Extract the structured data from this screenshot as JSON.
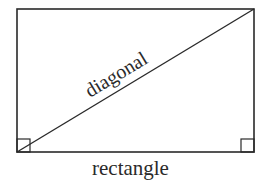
{
  "diagram": {
    "title": "rectangle",
    "shape": "rectangle",
    "labels": {
      "diagonal": "diagonal",
      "shape_name": "rectangle"
    },
    "rectangle": {
      "x": 17,
      "y": 9,
      "width": 237,
      "height": 143
    },
    "diagonal_line": {
      "from": [
        17,
        152
      ],
      "to": [
        254,
        9
      ]
    },
    "right_angle_markers": [
      {
        "corner": "bottom-left",
        "x": 17,
        "y": 139,
        "size": 13
      },
      {
        "corner": "bottom-right",
        "x": 241,
        "y": 139,
        "size": 13
      }
    ],
    "colors": {
      "stroke": "#2a2a2a",
      "background": "#ffffff"
    }
  }
}
